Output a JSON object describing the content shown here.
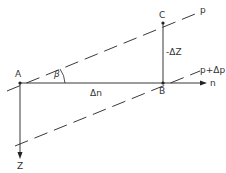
{
  "diagram": {
    "points": {
      "A": {
        "label": "A",
        "x": 20,
        "y": 83
      },
      "B": {
        "label": "B",
        "x": 163,
        "y": 83
      },
      "C": {
        "label": "C",
        "x": 163,
        "y": 23
      }
    },
    "lines": {
      "p": {
        "label": "p"
      },
      "p_plus_dp": {
        "label": "p+Δp"
      },
      "n_axis": {
        "label": "n"
      },
      "z_axis": {
        "label": "Z"
      }
    },
    "annotations": {
      "angle": "β",
      "dn": "Δn",
      "dz": "-ΔZ"
    },
    "colors": {
      "stroke": "#222222",
      "background": "#ffffff"
    }
  }
}
